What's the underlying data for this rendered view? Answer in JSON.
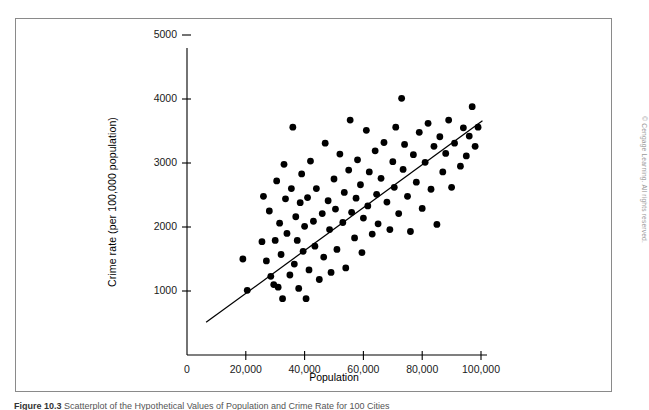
{
  "figure": {
    "caption_label": "Figure",
    "caption_number": "10.3",
    "caption_text": "Scatterplot of the Hypothetical Values of Population and Crime Rate for 100 Cities",
    "copyright": "© Cengage Learning. All rights reserved."
  },
  "chart_data": {
    "type": "scatter",
    "title": "",
    "xlabel": "Population",
    "ylabel": "Crime rate (per 100,000 population)",
    "xlim": [
      0,
      104000
    ],
    "ylim": [
      0,
      5400
    ],
    "xticks": [
      0,
      20000,
      40000,
      60000,
      80000,
      100000
    ],
    "xtick_labels": [
      "0",
      "20,000",
      "40,000",
      "60,000",
      "80,000",
      "100,000"
    ],
    "yticks": [
      1000,
      2000,
      3000,
      4000,
      5000
    ],
    "ytick_labels": [
      "1000",
      "2000",
      "3000",
      "4000",
      "5000"
    ],
    "grid": false,
    "legend": null,
    "marker": "filled-circle",
    "marker_color": "#000000",
    "marker_size": 3.4,
    "axis_color": "#000000",
    "trendline": {
      "type": "linear-fit",
      "color": "#000000",
      "x_start": 6500,
      "y_start": 510,
      "x_end": 100500,
      "y_end": 3660
    },
    "points": [
      [
        19000,
        1500
      ],
      [
        20500,
        1010
      ],
      [
        25500,
        1770
      ],
      [
        26000,
        2480
      ],
      [
        27000,
        1470
      ],
      [
        28000,
        2250
      ],
      [
        28500,
        1230
      ],
      [
        29500,
        1100
      ],
      [
        30000,
        1790
      ],
      [
        30500,
        2720
      ],
      [
        31000,
        1060
      ],
      [
        31500,
        2060
      ],
      [
        32000,
        1570
      ],
      [
        32500,
        880
      ],
      [
        33000,
        2980
      ],
      [
        33500,
        2440
      ],
      [
        34000,
        1900
      ],
      [
        35000,
        1250
      ],
      [
        35500,
        2600
      ],
      [
        36000,
        3560
      ],
      [
        36500,
        1420
      ],
      [
        37000,
        2160
      ],
      [
        37500,
        1790
      ],
      [
        38000,
        1040
      ],
      [
        38500,
        2380
      ],
      [
        39000,
        2830
      ],
      [
        39500,
        1620
      ],
      [
        40000,
        2010
      ],
      [
        40500,
        880
      ],
      [
        41000,
        2460
      ],
      [
        41500,
        1330
      ],
      [
        42000,
        3030
      ],
      [
        43000,
        2090
      ],
      [
        43500,
        1700
      ],
      [
        44000,
        2600
      ],
      [
        45000,
        1180
      ],
      [
        46000,
        2210
      ],
      [
        46500,
        1530
      ],
      [
        47000,
        3310
      ],
      [
        48000,
        2410
      ],
      [
        48500,
        1960
      ],
      [
        49000,
        1290
      ],
      [
        50000,
        2750
      ],
      [
        50500,
        2280
      ],
      [
        51000,
        1650
      ],
      [
        52000,
        3140
      ],
      [
        53000,
        2070
      ],
      [
        53500,
        2540
      ],
      [
        54000,
        1360
      ],
      [
        55000,
        2890
      ],
      [
        55500,
        3670
      ],
      [
        56000,
        2230
      ],
      [
        57000,
        1830
      ],
      [
        57500,
        2450
      ],
      [
        58000,
        3050
      ],
      [
        59000,
        2660
      ],
      [
        59500,
        1600
      ],
      [
        60000,
        2140
      ],
      [
        61000,
        3510
      ],
      [
        61500,
        2330
      ],
      [
        62000,
        2860
      ],
      [
        63000,
        1890
      ],
      [
        64000,
        3190
      ],
      [
        64500,
        2510
      ],
      [
        65000,
        2050
      ],
      [
        66000,
        2760
      ],
      [
        67000,
        3320
      ],
      [
        68000,
        2390
      ],
      [
        69000,
        1960
      ],
      [
        70000,
        3020
      ],
      [
        70500,
        2620
      ],
      [
        71000,
        3560
      ],
      [
        72000,
        2210
      ],
      [
        73000,
        4010
      ],
      [
        73500,
        2900
      ],
      [
        74000,
        3290
      ],
      [
        75000,
        2480
      ],
      [
        76000,
        1930
      ],
      [
        77000,
        3130
      ],
      [
        78000,
        2700
      ],
      [
        79000,
        3480
      ],
      [
        80000,
        2290
      ],
      [
        81000,
        3010
      ],
      [
        82000,
        3620
      ],
      [
        83000,
        2590
      ],
      [
        84000,
        3260
      ],
      [
        85000,
        2040
      ],
      [
        86000,
        3410
      ],
      [
        87000,
        2860
      ],
      [
        88000,
        3150
      ],
      [
        89000,
        3670
      ],
      [
        90000,
        2620
      ],
      [
        91000,
        3310
      ],
      [
        93000,
        2950
      ],
      [
        94000,
        3550
      ],
      [
        95000,
        3110
      ],
      [
        96000,
        3420
      ],
      [
        97000,
        3880
      ],
      [
        98000,
        3260
      ],
      [
        99000,
        3560
      ]
    ]
  }
}
